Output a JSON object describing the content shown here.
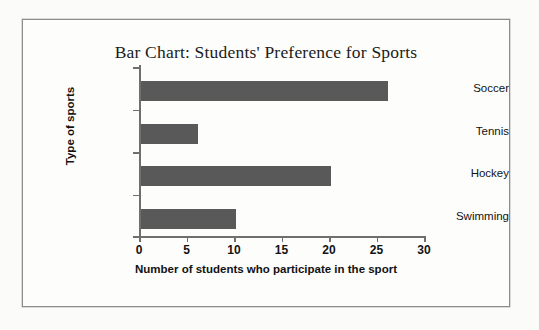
{
  "chart_data": {
    "type": "bar",
    "orientation": "horizontal",
    "title": "Bar Chart: Students' Preference for Sports",
    "xlabel": "Number of students who participate in the sport",
    "ylabel": "Type of sports",
    "categories": [
      "Soccer",
      "Tennis",
      "Hockey",
      "Swimming"
    ],
    "values": [
      26,
      6,
      20,
      10
    ],
    "xlim": [
      0,
      30
    ],
    "xticks": [
      0,
      5,
      10,
      15,
      20,
      25,
      30
    ],
    "xtick_labels": [
      "0",
      "5",
      "10",
      "15",
      "20",
      "25",
      "30"
    ],
    "grid": false,
    "legend": false,
    "bar_color": "#595959",
    "axis_color": "#6f6f6f",
    "background_color": "#fdfdfc",
    "frame_color": "#8d8d8d",
    "text_color": "#121212"
  }
}
